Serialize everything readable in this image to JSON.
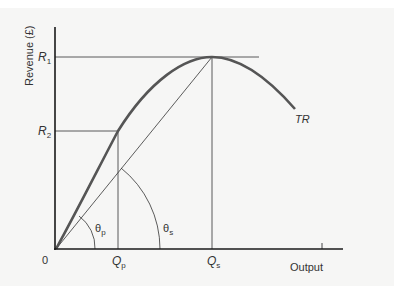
{
  "diagram": {
    "y_axis_label": "Revenue (£)",
    "x_axis_label": "Output",
    "origin_label": "0",
    "curve_label": "TR",
    "y_ticks": [
      {
        "main": "R",
        "sub": "1"
      },
      {
        "main": "R",
        "sub": "2"
      }
    ],
    "x_ticks": [
      {
        "main": "Q",
        "sub": "p"
      },
      {
        "main": "Q",
        "sub": "s"
      }
    ],
    "angles": [
      {
        "main": "θ",
        "sub": "p"
      },
      {
        "main": "θ",
        "sub": "s"
      }
    ],
    "colors": {
      "axis": "#1a1a1a",
      "curve": "#555555",
      "guide": "#333333",
      "background": "#f6f6f5"
    }
  }
}
